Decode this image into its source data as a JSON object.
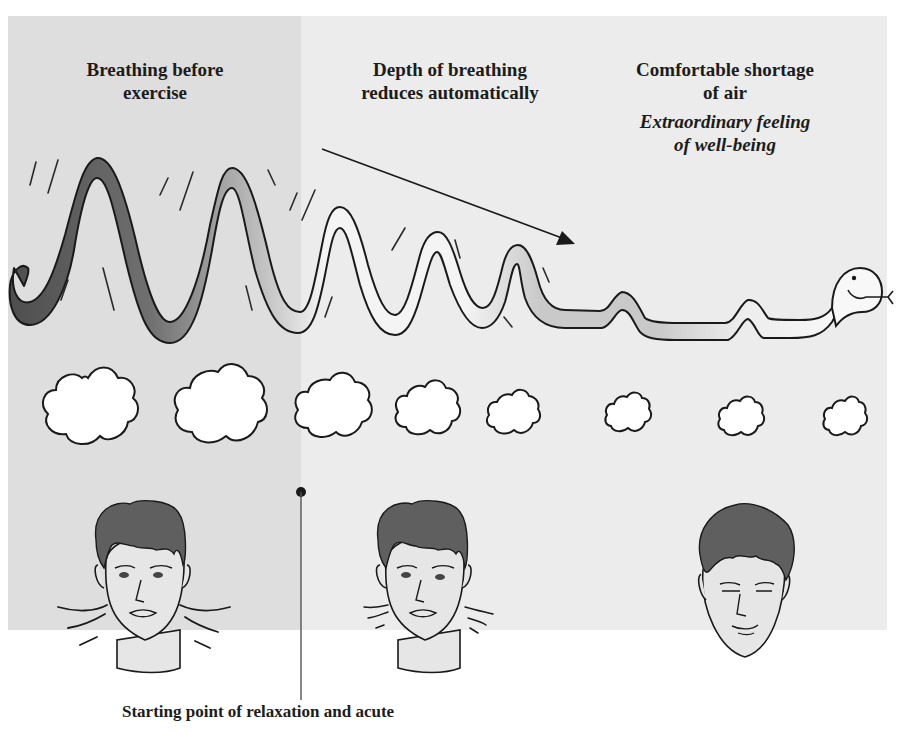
{
  "headings": {
    "stage_1": {
      "line_1": "Breathing before",
      "line_2": "exercise"
    },
    "stage_2": {
      "line_1": "Depth of breathing",
      "line_2": "reduces automatically"
    },
    "stage_3": {
      "line_1": "Comfortable shortage",
      "line_2": "of air",
      "subtitle_1": "Extraordinary feeling",
      "subtitle_2": "of well-being"
    }
  },
  "caption": "Starting point of relaxation and acute",
  "illustration": {
    "breath_wave": "snake-shaped wave decreasing in amplitude from left to right",
    "arrow": "downward diagonal arrow indicating reduction",
    "clouds_count": 8,
    "faces": [
      "tense face with motion lines",
      "less tense face with fewer motion lines",
      "relaxed smiling face"
    ]
  },
  "colors": {
    "panel_left": "#dedede",
    "panel_right": "#ececec",
    "wave_dark": "#555555",
    "wave_mid": "#a8a8a8",
    "wave_light": "#cfcfcf",
    "hair": "#5f5f5f",
    "skin": "#e6e6e6",
    "outline": "#1a1a1a"
  }
}
